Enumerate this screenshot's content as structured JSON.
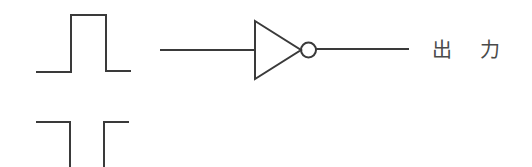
{
  "diagram": {
    "type": "logic-gate-schematic",
    "components": [
      {
        "id": "input-pulse",
        "kind": "waveform",
        "shape": "positive-pulse"
      },
      {
        "id": "output-pulse",
        "kind": "waveform",
        "shape": "negative-pulse"
      },
      {
        "id": "input-wire",
        "kind": "wire"
      },
      {
        "id": "not-gate",
        "kind": "inverter"
      },
      {
        "id": "output-wire",
        "kind": "wire"
      }
    ],
    "labels": {
      "output_char1": "出",
      "output_char2": "力"
    },
    "colors": {
      "stroke": "#3a3a3a",
      "text": "#4a4a4a",
      "background": "#ffffff"
    }
  }
}
